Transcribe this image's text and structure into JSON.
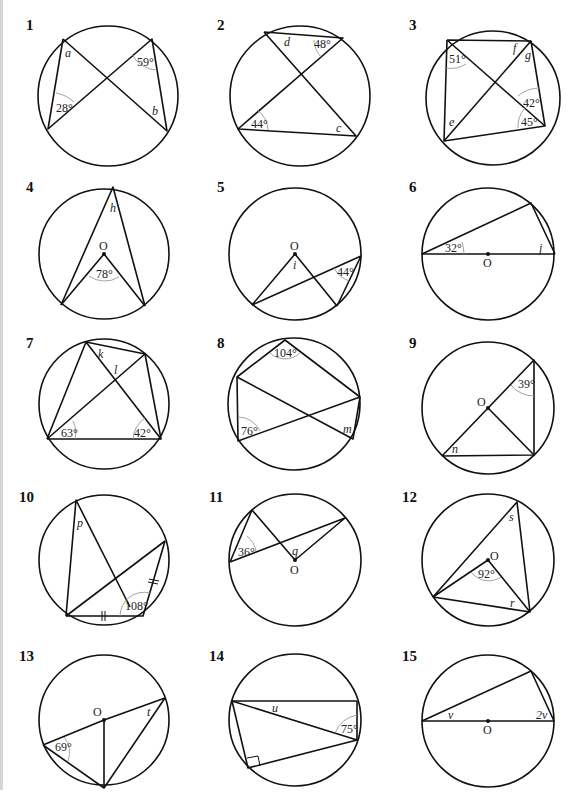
{
  "header": {
    "cut_text": "Find the size of each lettered angle. Give reasons for each step of your working."
  },
  "questions": [
    {
      "number": "1",
      "angles": [
        "28°",
        "59°"
      ],
      "unknowns": [
        "a",
        "b"
      ]
    },
    {
      "number": "2",
      "angles": [
        "48°",
        "44°"
      ],
      "unknowns": [
        "d",
        "c"
      ]
    },
    {
      "number": "3",
      "angles": [
        "51°",
        "42°",
        "45°"
      ],
      "unknowns": [
        "f",
        "g",
        "e"
      ]
    },
    {
      "number": "4",
      "angles": [
        "78°"
      ],
      "unknowns": [
        "h"
      ],
      "center": "O"
    },
    {
      "number": "5",
      "angles": [
        "44°"
      ],
      "unknowns": [
        "i"
      ],
      "center": "O"
    },
    {
      "number": "6",
      "angles": [
        "32°"
      ],
      "unknowns": [
        "j"
      ],
      "center": "O"
    },
    {
      "number": "7",
      "angles": [
        "63°",
        "42°"
      ],
      "unknowns": [
        "k",
        "l"
      ]
    },
    {
      "number": "8",
      "angles": [
        "104°",
        "76°"
      ],
      "unknowns": [
        "m"
      ]
    },
    {
      "number": "9",
      "angles": [
        "39°"
      ],
      "unknowns": [
        "n"
      ],
      "center": "O"
    },
    {
      "number": "10",
      "angles": [
        "108°"
      ],
      "unknowns": [
        "p"
      ]
    },
    {
      "number": "11",
      "angles": [
        "36°"
      ],
      "unknowns": [
        "q"
      ],
      "center": "O"
    },
    {
      "number": "12",
      "angles": [
        "92°"
      ],
      "unknowns": [
        "s",
        "r"
      ],
      "center": "O"
    },
    {
      "number": "13",
      "angles": [
        "69°"
      ],
      "unknowns": [
        "t"
      ],
      "center": "O"
    },
    {
      "number": "14",
      "angles": [
        "75°"
      ],
      "unknowns": [
        "u"
      ]
    },
    {
      "number": "15",
      "angles": [],
      "unknowns": [
        "v",
        "2v"
      ],
      "center": "O"
    }
  ]
}
